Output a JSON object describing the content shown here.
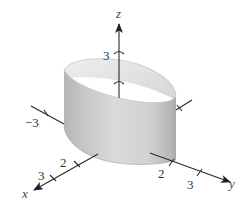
{
  "figure": {
    "type": "3d-surface-plot",
    "surface": "elliptic cylinder (vertical, parallel to z-axis)",
    "colors": {
      "axis": "#2a2a2a",
      "surface_light": "#e2e2e2",
      "surface_dark": "#a9a9a9",
      "background": "#ffffff"
    },
    "axes": {
      "z": {
        "label": "z",
        "ticks": [
          {
            "value": "3",
            "label": "3"
          }
        ]
      },
      "x": {
        "label": "x",
        "ticks": [
          {
            "value": "2",
            "label": "2"
          },
          {
            "value": "3",
            "label": "3"
          }
        ]
      },
      "y": {
        "label": "y",
        "ticks": [
          {
            "value": "2",
            "label": "2"
          },
          {
            "value": "3",
            "label": "3"
          }
        ]
      },
      "neg_y": {
        "ticks": [
          {
            "value": "-3",
            "label": "−3"
          }
        ]
      }
    }
  }
}
